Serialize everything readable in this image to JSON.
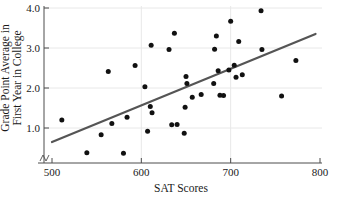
{
  "chart_data": {
    "type": "scatter",
    "title": "",
    "xlabel": "SAT Scores",
    "ylabel_line1": "Grade Point Average in",
    "ylabel_line2": "First Year in College",
    "xlim": [
      490,
      805
    ],
    "ylim": [
      0.3,
      4.05
    ],
    "xticks": [
      500,
      600,
      700,
      800
    ],
    "xtick_labels": [
      "500",
      "600",
      "700",
      "800"
    ],
    "yticks": [
      1.0,
      2.0,
      3.0,
      4.0
    ],
    "ytick_labels": [
      "1.0",
      "2.0",
      "3.0",
      "4.0"
    ],
    "grid": true,
    "legend": "none",
    "axis_break_x": true,
    "point_color": "#111111",
    "line_color": "#555555",
    "grid_color": "#e8e8e8",
    "axis_color": "#4d4d4d",
    "points": [
      [
        511,
        1.2
      ],
      [
        539,
        0.38
      ],
      [
        555,
        0.83
      ],
      [
        563,
        2.41
      ],
      [
        567,
        1.11
      ],
      [
        580,
        0.37
      ],
      [
        584,
        1.27
      ],
      [
        593,
        2.56
      ],
      [
        604,
        2.03
      ],
      [
        607,
        0.92
      ],
      [
        610,
        1.54
      ],
      [
        611,
        3.07
      ],
      [
        612,
        1.38
      ],
      [
        631,
        2.96
      ],
      [
        634,
        1.08
      ],
      [
        637,
        3.37
      ],
      [
        640,
        1.09
      ],
      [
        648,
        0.87
      ],
      [
        649,
        1.52
      ],
      [
        650,
        2.29
      ],
      [
        651,
        2.11
      ],
      [
        657,
        1.77
      ],
      [
        667,
        1.84
      ],
      [
        681,
        2.11
      ],
      [
        682,
        2.97
      ],
      [
        684,
        3.3
      ],
      [
        686,
        2.43
      ],
      [
        688,
        1.82
      ],
      [
        692,
        1.81
      ],
      [
        698,
        2.45
      ],
      [
        700,
        3.67
      ],
      [
        704,
        2.57
      ],
      [
        706,
        2.27
      ],
      [
        709,
        3.16
      ],
      [
        713,
        2.33
      ],
      [
        734,
        3.93
      ],
      [
        735,
        2.96
      ],
      [
        757,
        1.8
      ],
      [
        773,
        2.69
      ]
    ],
    "trend_line": {
      "x_start": 500,
      "y_start": 0.65,
      "x_end": 795,
      "y_end": 3.35
    }
  }
}
